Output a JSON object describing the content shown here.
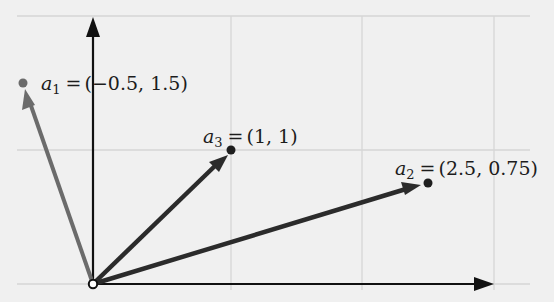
{
  "diagram": {
    "title": "",
    "origin": [
      0,
      0
    ],
    "grid": {
      "x_lines": [
        -0.5,
        1,
        2,
        3
      ],
      "y_lines": [
        0,
        1,
        2
      ],
      "color": "#d4d4d4"
    },
    "axes": {
      "color": "#111111"
    },
    "vectors": [
      {
        "id": "a1",
        "name": "a",
        "sub": "1",
        "eq": "=",
        "coords_text": "(−0.5, 1.5)",
        "x": -0.5,
        "y": 1.5,
        "color": "#6b6b6b"
      },
      {
        "id": "a2",
        "name": "a",
        "sub": "2",
        "eq": "=",
        "coords_text": "(2.5, 0.75)",
        "x": 2.5,
        "y": 0.75,
        "color": "#2b2b2b"
      },
      {
        "id": "a3",
        "name": "a",
        "sub": "3",
        "eq": "=",
        "coords_text": "(1, 1)",
        "x": 1,
        "y": 1,
        "color": "#2b2b2b"
      }
    ]
  }
}
